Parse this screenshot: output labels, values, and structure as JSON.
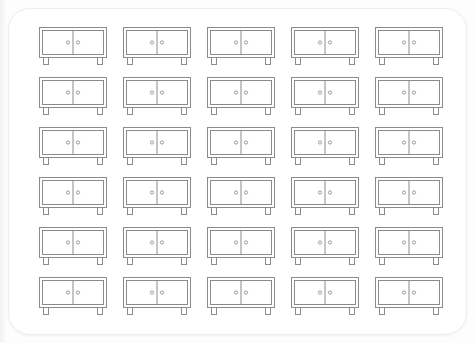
{
  "canvas": {
    "width": 475,
    "height": 343,
    "background_color": "#fdfdfd",
    "card_background_color": "#ffffff",
    "card_border_color": "#eeeeee",
    "card_corner_radius": "22px"
  },
  "artwork": {
    "subject": "sideboard-cabinet",
    "description": "Line-art icon of a two-door sideboard cabinet with legs",
    "style": "outline",
    "stroke_color": "#8a8a8f",
    "knob_color": "#9a9aa0",
    "fill_color": "#ffffff",
    "stroke_width": 1
  },
  "grid": {
    "rows": 6,
    "columns": 5,
    "total_icons": 30,
    "icon_label": "sideboard-cabinet-icon"
  },
  "icons": [
    {
      "id": 1,
      "row": 1,
      "col": 1,
      "label": "sideboard-cabinet-icon"
    },
    {
      "id": 2,
      "row": 1,
      "col": 2,
      "label": "sideboard-cabinet-icon"
    },
    {
      "id": 3,
      "row": 1,
      "col": 3,
      "label": "sideboard-cabinet-icon"
    },
    {
      "id": 4,
      "row": 1,
      "col": 4,
      "label": "sideboard-cabinet-icon"
    },
    {
      "id": 5,
      "row": 1,
      "col": 5,
      "label": "sideboard-cabinet-icon"
    },
    {
      "id": 6,
      "row": 2,
      "col": 1,
      "label": "sideboard-cabinet-icon"
    },
    {
      "id": 7,
      "row": 2,
      "col": 2,
      "label": "sideboard-cabinet-icon"
    },
    {
      "id": 8,
      "row": 2,
      "col": 3,
      "label": "sideboard-cabinet-icon"
    },
    {
      "id": 9,
      "row": 2,
      "col": 4,
      "label": "sideboard-cabinet-icon"
    },
    {
      "id": 10,
      "row": 2,
      "col": 5,
      "label": "sideboard-cabinet-icon"
    },
    {
      "id": 11,
      "row": 3,
      "col": 1,
      "label": "sideboard-cabinet-icon"
    },
    {
      "id": 12,
      "row": 3,
      "col": 2,
      "label": "sideboard-cabinet-icon"
    },
    {
      "id": 13,
      "row": 3,
      "col": 3,
      "label": "sideboard-cabinet-icon"
    },
    {
      "id": 14,
      "row": 3,
      "col": 4,
      "label": "sideboard-cabinet-icon"
    },
    {
      "id": 15,
      "row": 3,
      "col": 5,
      "label": "sideboard-cabinet-icon"
    },
    {
      "id": 16,
      "row": 4,
      "col": 1,
      "label": "sideboard-cabinet-icon"
    },
    {
      "id": 17,
      "row": 4,
      "col": 2,
      "label": "sideboard-cabinet-icon"
    },
    {
      "id": 18,
      "row": 4,
      "col": 3,
      "label": "sideboard-cabinet-icon"
    },
    {
      "id": 19,
      "row": 4,
      "col": 4,
      "label": "sideboard-cabinet-icon"
    },
    {
      "id": 20,
      "row": 4,
      "col": 5,
      "label": "sideboard-cabinet-icon"
    },
    {
      "id": 21,
      "row": 5,
      "col": 1,
      "label": "sideboard-cabinet-icon"
    },
    {
      "id": 22,
      "row": 5,
      "col": 2,
      "label": "sideboard-cabinet-icon"
    },
    {
      "id": 23,
      "row": 5,
      "col": 3,
      "label": "sideboard-cabinet-icon"
    },
    {
      "id": 24,
      "row": 5,
      "col": 4,
      "label": "sideboard-cabinet-icon"
    },
    {
      "id": 25,
      "row": 5,
      "col": 5,
      "label": "sideboard-cabinet-icon"
    },
    {
      "id": 26,
      "row": 6,
      "col": 1,
      "label": "sideboard-cabinet-icon"
    },
    {
      "id": 27,
      "row": 6,
      "col": 2,
      "label": "sideboard-cabinet-icon"
    },
    {
      "id": 28,
      "row": 6,
      "col": 3,
      "label": "sideboard-cabinet-icon"
    },
    {
      "id": 29,
      "row": 6,
      "col": 4,
      "label": "sideboard-cabinet-icon"
    },
    {
      "id": 30,
      "row": 6,
      "col": 5,
      "label": "sideboard-cabinet-icon"
    }
  ]
}
